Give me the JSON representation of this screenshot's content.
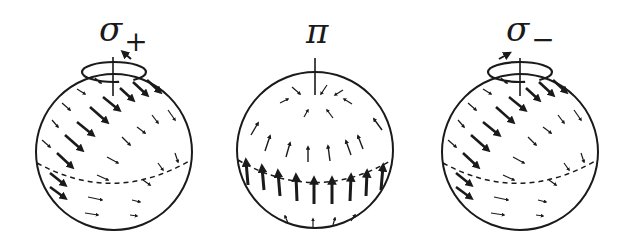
{
  "figure": {
    "ink_color": "#1a1a1a",
    "background": "#ffffff",
    "panels": [
      {
        "id": "sigma-plus",
        "label_symbol": "σ",
        "label_subscript": "+",
        "polarization": "sigma_plus",
        "center": [
          114,
          152
        ],
        "radius": 78,
        "rotation_loop": true,
        "rotation_arrow_direction": "counterclockwise-from-above",
        "equator_dashed": true
      },
      {
        "id": "pi",
        "label_symbol": "π",
        "label_subscript": "",
        "polarization": "pi",
        "center": [
          315,
          150
        ],
        "radius": 78,
        "rotation_loop": false,
        "equator_dashed": true
      },
      {
        "id": "sigma-minus",
        "label_symbol": "σ",
        "label_subscript": "−",
        "polarization": "sigma_minus",
        "center": [
          520,
          152
        ],
        "radius": 78,
        "rotation_loop": true,
        "rotation_arrow_direction": "clockwise-from-above",
        "equator_dashed": true
      }
    ]
  },
  "labels": {
    "sigma_plus_symbol": "σ",
    "sigma_plus_sub": "+",
    "pi_symbol": "π",
    "sigma_minus_symbol": "σ",
    "sigma_minus_sub": "−"
  },
  "arrows": {
    "sigma": [
      {
        "x1": -19,
        "y1": -74,
        "x2": -13,
        "y2": -69,
        "w": 1.2
      },
      {
        "x1": -37,
        "y1": -63,
        "x2": -29,
        "y2": -58,
        "w": 1.2
      },
      {
        "x1": -11,
        "y1": -55,
        "x2": 5,
        "y2": -42,
        "w": 2.6
      },
      {
        "x1": 6,
        "y1": -64,
        "x2": 19,
        "y2": -52,
        "w": 2.6
      },
      {
        "x1": 19,
        "y1": -70,
        "x2": 33,
        "y2": -57,
        "w": 2.6
      },
      {
        "x1": 33,
        "y1": -72,
        "x2": 46,
        "y2": -60,
        "w": 2.6
      },
      {
        "x1": -52,
        "y1": -49,
        "x2": -44,
        "y2": -42,
        "w": 1.2
      },
      {
        "x1": -24,
        "y1": -45,
        "x2": -7,
        "y2": -30,
        "w": 2.6
      },
      {
        "x1": 38,
        "y1": -37,
        "x2": 44,
        "y2": -29,
        "w": 1.2
      },
      {
        "x1": 54,
        "y1": -42,
        "x2": 61,
        "y2": -32,
        "w": 1.2
      },
      {
        "x1": -62,
        "y1": -32,
        "x2": -56,
        "y2": -25,
        "w": 1.2
      },
      {
        "x1": -37,
        "y1": -30,
        "x2": -21,
        "y2": -17,
        "w": 2.6
      },
      {
        "x1": 23,
        "y1": -25,
        "x2": 31,
        "y2": -19,
        "w": 1.2
      },
      {
        "x1": -72,
        "y1": -12,
        "x2": -64,
        "y2": -5,
        "w": 1.2
      },
      {
        "x1": -49,
        "y1": -17,
        "x2": -32,
        "y2": -2,
        "w": 2.6
      },
      {
        "x1": 8,
        "y1": -15,
        "x2": 16,
        "y2": -7,
        "w": 1.2
      },
      {
        "x1": -7,
        "y1": 5,
        "x2": 4,
        "y2": 11,
        "w": 1.2
      },
      {
        "x1": -57,
        "y1": 1,
        "x2": -42,
        "y2": 15,
        "w": 2.6
      },
      {
        "x1": 61,
        "y1": 1,
        "x2": 64,
        "y2": 10,
        "w": 1.2
      },
      {
        "x1": 44,
        "y1": 11,
        "x2": 49,
        "y2": 18,
        "w": 1.2
      },
      {
        "x1": -64,
        "y1": 21,
        "x2": -49,
        "y2": 33,
        "w": 2.6
      },
      {
        "x1": -17,
        "y1": 23,
        "x2": -6,
        "y2": 28,
        "w": 1.2
      },
      {
        "x1": 29,
        "y1": 28,
        "x2": 36,
        "y2": 33,
        "w": 1.2
      },
      {
        "x1": -64,
        "y1": 35,
        "x2": -49,
        "y2": 46,
        "w": 2.6
      },
      {
        "x1": -26,
        "y1": 45,
        "x2": -12,
        "y2": 48,
        "w": 1.2
      },
      {
        "x1": 18,
        "y1": 48,
        "x2": 26,
        "y2": 50,
        "w": 1.2
      },
      {
        "x1": -29,
        "y1": 61,
        "x2": -16,
        "y2": 63,
        "w": 1.2
      },
      {
        "x1": 16,
        "y1": 63,
        "x2": 23,
        "y2": 64,
        "w": 1.2
      }
    ],
    "pi": [
      {
        "x1": -23,
        "y1": -63,
        "x2": -15,
        "y2": -56,
        "w": 1.2
      },
      {
        "x1": 12,
        "y1": -65,
        "x2": 6,
        "y2": -56,
        "w": 1.2
      },
      {
        "x1": 28,
        "y1": -60,
        "x2": 20,
        "y2": -55,
        "w": 1.2
      },
      {
        "x1": -35,
        "y1": -47,
        "x2": -27,
        "y2": -51,
        "w": 1.2
      },
      {
        "x1": 37,
        "y1": -46,
        "x2": 29,
        "y2": -51,
        "w": 1.2
      },
      {
        "x1": -11,
        "y1": -33,
        "x2": -7,
        "y2": -40,
        "w": 1.2
      },
      {
        "x1": 18,
        "y1": -32,
        "x2": 12,
        "y2": -40,
        "w": 1.2
      },
      {
        "x1": -64,
        "y1": -15,
        "x2": -57,
        "y2": -27,
        "w": 1.4
      },
      {
        "x1": 67,
        "y1": -20,
        "x2": 59,
        "y2": -31,
        "w": 1.4
      },
      {
        "x1": -50,
        "y1": 1,
        "x2": -45,
        "y2": -14,
        "w": 1.4
      },
      {
        "x1": 48,
        "y1": -1,
        "x2": 43,
        "y2": -14,
        "w": 1.4
      },
      {
        "x1": -29,
        "y1": 7,
        "x2": -25,
        "y2": -7,
        "w": 1.4
      },
      {
        "x1": 36,
        "y1": 5,
        "x2": 31,
        "y2": -9,
        "w": 1.4
      },
      {
        "x1": -7,
        "y1": 12,
        "x2": -7,
        "y2": -3,
        "w": 1.4
      },
      {
        "x1": 15,
        "y1": 11,
        "x2": 13,
        "y2": -4,
        "w": 1.4
      },
      {
        "x1": -67,
        "y1": 35,
        "x2": -69,
        "y2": 11,
        "w": 3
      },
      {
        "x1": -51,
        "y1": 40,
        "x2": -53,
        "y2": 17,
        "w": 3
      },
      {
        "x1": -35,
        "y1": 46,
        "x2": -37,
        "y2": 22,
        "w": 3
      },
      {
        "x1": -18,
        "y1": 51,
        "x2": -19,
        "y2": 26,
        "w": 3
      },
      {
        "x1": -1,
        "y1": 54,
        "x2": -1,
        "y2": 29,
        "w": 3
      },
      {
        "x1": 17,
        "y1": 54,
        "x2": 17,
        "y2": 29,
        "w": 3
      },
      {
        "x1": 35,
        "y1": 51,
        "x2": 36,
        "y2": 26,
        "w": 3
      },
      {
        "x1": 51,
        "y1": 46,
        "x2": 52,
        "y2": 22,
        "w": 3
      },
      {
        "x1": 66,
        "y1": 40,
        "x2": 68,
        "y2": 16,
        "w": 3
      },
      {
        "x1": -27,
        "y1": 73,
        "x2": -30,
        "y2": 66,
        "w": 1.2
      },
      {
        "x1": -2,
        "y1": 77,
        "x2": -2,
        "y2": 69,
        "w": 1.2
      },
      {
        "x1": 18,
        "y1": 75,
        "x2": 20,
        "y2": 68,
        "w": 1.2
      },
      {
        "x1": 36,
        "y1": 71,
        "x2": 40,
        "y2": 65,
        "w": 1.2
      }
    ]
  }
}
